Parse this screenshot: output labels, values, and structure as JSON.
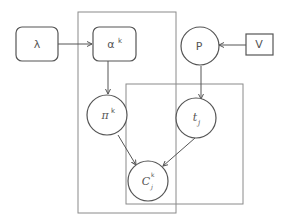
{
  "diagram": {
    "type": "plate-notation graphical model",
    "colors": {
      "stroke": "#555555",
      "plate": "#8a8a8a",
      "background": "#ffffff"
    },
    "nodes": {
      "lambda": {
        "label": "λ",
        "shape": "rounded-rect"
      },
      "alpha": {
        "label": "α",
        "sup": "k",
        "shape": "rounded-rect"
      },
      "P": {
        "label": "P",
        "shape": "circle"
      },
      "V": {
        "label": "V",
        "shape": "rect"
      },
      "pi": {
        "label": "π",
        "sup": "k",
        "shape": "circle"
      },
      "t": {
        "label": "t",
        "sub": "j",
        "shape": "circle"
      },
      "C": {
        "label": "C",
        "sup": "k",
        "sub": "j",
        "shape": "circle"
      }
    },
    "edges": [
      {
        "from": "λ",
        "to": "α^k"
      },
      {
        "from": "α^k",
        "to": "π^k"
      },
      {
        "from": "V",
        "to": "P"
      },
      {
        "from": "P",
        "to": "t_j"
      },
      {
        "from": "π^k",
        "to": "C_j^k"
      },
      {
        "from": "t_j",
        "to": "C_j^k"
      }
    ],
    "plates": [
      {
        "name": "k-plate",
        "contains": [
          "α^k",
          "π^k",
          "C_j^k"
        ]
      },
      {
        "name": "j-plate",
        "contains": [
          "t_j",
          "C_j^k"
        ]
      }
    ]
  }
}
